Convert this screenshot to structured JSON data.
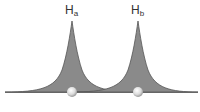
{
  "diagram": {
    "atoms": [
      {
        "label": "H",
        "subscript": "a",
        "x": 72
      },
      {
        "label": "H",
        "subscript": "b",
        "x": 138
      }
    ],
    "colors": {
      "fill": "#8a8a8a",
      "outline": "#555555",
      "baseline": "#666666",
      "nucleus": "#e8e8e8"
    }
  }
}
